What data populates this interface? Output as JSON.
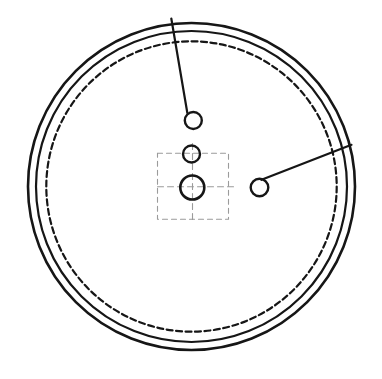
{
  "drawing": {
    "canvas": {
      "width": 382,
      "height": 379,
      "background": "#ffffff"
    },
    "ink_color": "#161616",
    "construction_color": "#9b9b9b",
    "rings": [
      {
        "name": "outer-rim-circle",
        "cx": 191.5,
        "cy": 186.5,
        "r": 163.5,
        "stroke_width": 2.6,
        "dash": ""
      },
      {
        "name": "inner-rim-circle",
        "cx": 191.5,
        "cy": 186.5,
        "r": 155.5,
        "stroke_width": 2.2,
        "dash": ""
      },
      {
        "name": "pitch-dashed-circle",
        "cx": 191.5,
        "cy": 186.5,
        "r": 145.2,
        "stroke_width": 2.2,
        "dash": "6 3.5"
      }
    ],
    "holes": [
      {
        "name": "top-hole",
        "cx": 193.3,
        "cy": 120.5,
        "r": 8.5,
        "stroke_width": 2.4
      },
      {
        "name": "upper-middle-hole",
        "cx": 191.5,
        "cy": 154.0,
        "r": 8.5,
        "stroke_width": 2.4
      },
      {
        "name": "center-hole",
        "cx": 192.3,
        "cy": 187.5,
        "r": 12.0,
        "stroke_width": 2.6
      },
      {
        "name": "right-hole",
        "cx": 259.5,
        "cy": 187.5,
        "r": 8.8,
        "stroke_width": 2.4
      }
    ],
    "leader_lines": [
      {
        "name": "top-leader-line",
        "x1": 171.3,
        "y1": 18.5,
        "x2": 187.3,
        "y2": 112.8,
        "stroke_width": 2.2
      },
      {
        "name": "right-leader-line",
        "x1": 261.5,
        "y1": 179.8,
        "x2": 351.5,
        "y2": 144.8,
        "stroke_width": 2.2
      }
    ],
    "construction": {
      "square": {
        "name": "construction-square",
        "x": 157.5,
        "y": 153.2,
        "width": 71,
        "height": 66,
        "stroke_width": 1.1,
        "dash": "5 4"
      },
      "centerlines": [
        {
          "name": "vertical-centerline",
          "x1": 192.5,
          "y1": 143.5,
          "x2": 192.5,
          "y2": 221.5,
          "stroke_width": 1.1,
          "dash": "6 4"
        },
        {
          "name": "horizontal-centerline",
          "x1": 157.5,
          "y1": 186.8,
          "x2": 236.5,
          "y2": 186.8,
          "stroke_width": 1.1,
          "dash": "6 4"
        }
      ]
    }
  }
}
